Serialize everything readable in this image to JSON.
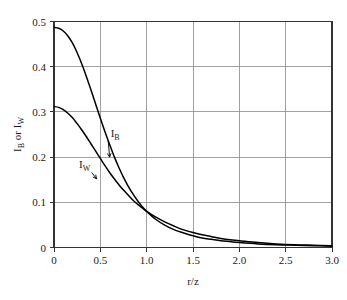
{
  "chart_data": {
    "type": "line",
    "title": "",
    "subtitle": "",
    "xlabel": "r/z",
    "ylabel": "I_B or I_W",
    "ylabel_parts": [
      "I",
      "B",
      " or I",
      "W"
    ],
    "xlim": [
      0,
      3.0
    ],
    "ylim": [
      0,
      0.5
    ],
    "grid": true,
    "legend_position": "inline-annotations",
    "xticks": [
      0,
      0.5,
      1.0,
      1.5,
      2.0,
      2.5,
      3.0
    ],
    "xtick_labels": [
      "0",
      "0.5",
      "1.0",
      "1.5",
      "2.0",
      "2.5",
      "3.0"
    ],
    "yticks": [
      0,
      0.1,
      0.2,
      0.3,
      0.4,
      0.5
    ],
    "ytick_labels": [
      "0",
      "0.1",
      "0.2",
      "0.3",
      "0.4",
      "0.5"
    ],
    "x": [
      0.0,
      0.05,
      0.1,
      0.15,
      0.2,
      0.25,
      0.3,
      0.35,
      0.4,
      0.45,
      0.5,
      0.55,
      0.6,
      0.65,
      0.7,
      0.75,
      0.8,
      0.85,
      0.9,
      0.95,
      1.0,
      1.1,
      1.2,
      1.3,
      1.4,
      1.5,
      1.6,
      1.7,
      1.8,
      1.9,
      2.0,
      2.2,
      2.4,
      2.6,
      2.8,
      3.0
    ],
    "series": [
      {
        "name": "I_B",
        "label": "I_B",
        "label_parts": [
          "I",
          "B"
        ],
        "color": "#000000",
        "values": [
          0.487,
          0.485,
          0.479,
          0.468,
          0.452,
          0.431,
          0.406,
          0.378,
          0.348,
          0.317,
          0.286,
          0.256,
          0.228,
          0.201,
          0.177,
          0.155,
          0.136,
          0.119,
          0.104,
          0.091,
          0.08,
          0.062,
          0.049,
          0.039,
          0.032,
          0.026,
          0.021,
          0.018,
          0.015,
          0.013,
          0.011,
          0.008,
          0.006,
          0.005,
          0.004,
          0.003
        ]
      },
      {
        "name": "I_W",
        "label": "I_W",
        "label_parts": [
          "I",
          "W"
        ],
        "color": "#000000",
        "values": [
          0.312,
          0.31,
          0.305,
          0.297,
          0.287,
          0.274,
          0.26,
          0.245,
          0.229,
          0.213,
          0.197,
          0.181,
          0.166,
          0.152,
          0.139,
          0.127,
          0.116,
          0.105,
          0.096,
          0.088,
          0.08,
          0.067,
          0.056,
          0.047,
          0.039,
          0.033,
          0.028,
          0.024,
          0.02,
          0.017,
          0.015,
          0.011,
          0.008,
          0.006,
          0.005,
          0.004
        ]
      }
    ],
    "annotations": [
      {
        "text": "I_B",
        "x": 0.66,
        "y": 0.245,
        "points_to_x": 0.6,
        "points_to_y": 0.2
      },
      {
        "text": "I_W",
        "x": 0.33,
        "y": 0.175,
        "points_to_x": 0.46,
        "points_to_y": 0.152
      }
    ]
  }
}
